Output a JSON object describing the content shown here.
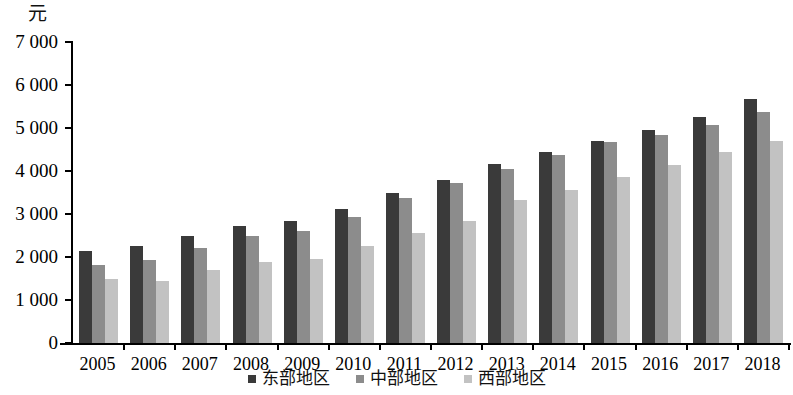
{
  "chart_data": {
    "type": "bar",
    "title": "",
    "subtitle": "",
    "unit_label": "元",
    "xlabel": "",
    "ylabel": "元",
    "ylim": [
      0,
      7000
    ],
    "ytick_step": 1000,
    "ytick_labels": [
      "7 000",
      "6 000",
      "5 000",
      "4 000",
      "3 000",
      "2 000",
      "1 000",
      "0"
    ],
    "ytick_values": [
      7000,
      6000,
      5000,
      4000,
      3000,
      2000,
      1000,
      0
    ],
    "grid": false,
    "legend_position": "bottom-center",
    "categories": [
      "2005",
      "2006",
      "2007",
      "2008",
      "2009",
      "2010",
      "2011",
      "2012",
      "2013",
      "2014",
      "2015",
      "2016",
      "2017",
      "2018"
    ],
    "series": [
      {
        "name": "东部地区",
        "color": "#3a3a3a",
        "values": [
          2130,
          2250,
          2500,
          2730,
          2830,
          3110,
          3500,
          3800,
          4160,
          4440,
          4690,
          4950,
          5250,
          5670
        ]
      },
      {
        "name": "中部地区",
        "color": "#8c8c8c",
        "values": [
          1810,
          1930,
          2200,
          2480,
          2600,
          2940,
          3380,
          3730,
          4050,
          4380,
          4680,
          4840,
          5080,
          5380
        ]
      },
      {
        "name": "西部地区",
        "color": "#c2c2c2",
        "values": [
          1480,
          1450,
          1690,
          1880,
          1960,
          2250,
          2560,
          2840,
          3330,
          3570,
          3860,
          4150,
          4450,
          4700
        ]
      }
    ]
  },
  "legend": {
    "items": [
      {
        "label": "东部地区",
        "color": "#3a3a3a"
      },
      {
        "label": "中部地区",
        "color": "#8c8c8c"
      },
      {
        "label": "西部地区",
        "color": "#c2c2c2"
      }
    ]
  },
  "axis": {
    "unit": "元"
  }
}
